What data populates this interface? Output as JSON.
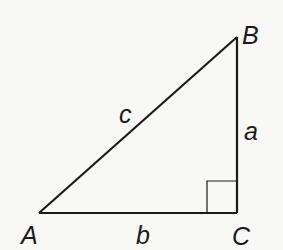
{
  "diagram": {
    "vertices": {
      "A": {
        "label": "A",
        "x": 39,
        "y": 213
      },
      "B": {
        "label": "B",
        "x": 237,
        "y": 37
      },
      "C": {
        "label": "C",
        "x": 237,
        "y": 213
      }
    },
    "sides": {
      "a": {
        "label": "a",
        "between": "B-C"
      },
      "b": {
        "label": "b",
        "between": "A-C"
      },
      "c": {
        "label": "c",
        "between": "A-B"
      }
    },
    "right_angle_at": "C",
    "colors": {
      "stroke": "#1a1a1a",
      "background": "#f8f8f6"
    }
  }
}
